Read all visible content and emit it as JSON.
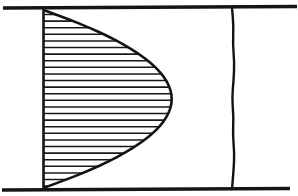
{
  "figure": {
    "background_color": "#ffffff",
    "ink_color": "#141414",
    "width": 298,
    "height": 196
  },
  "geometry": {
    "top_wall": {
      "name": "top-wall",
      "x1": 3,
      "y1": 8,
      "x2": 297,
      "y2": 6.5,
      "stroke_width": 3.4
    },
    "bottom_wall": {
      "name": "bottom-wall",
      "x1": 2,
      "y1": 190,
      "x2": 290,
      "y2": 188.5,
      "stroke_width": 3.4
    },
    "left_axis": {
      "name": "left-wall-axis",
      "x1": 43.5,
      "y1": 8,
      "x2": 43.5,
      "y2": 189,
      "stroke_width": 2.6
    },
    "laminar_profile": {
      "name": "laminar-parabolic-profile",
      "wall_x": 43.5,
      "apex_x": 172,
      "apex_y": 97,
      "top_y": 10,
      "bottom_y": 188,
      "stroke_width": 2.6
    },
    "turbulent_profile": {
      "name": "turbulent-flat-profile",
      "base_x": 232,
      "top_y": 8,
      "bottom_y": 189,
      "stroke_width": 2.4,
      "wave_amplitude": 2.4
    },
    "hatching": {
      "name": "hatch-fill",
      "line_count": 27,
      "spacing": 6.6,
      "first_y": 14.5,
      "stroke_width": 1.55,
      "orientation": "horizontal"
    }
  },
  "chart_data": {
    "type": "line",
    "xlabel": "",
    "ylabel": "",
    "grid": false,
    "legend": "none",
    "xlim": [
      0,
      1
    ],
    "ylim": [
      0,
      1
    ],
    "series": [
      {
        "name": "Laminar parabolic profile",
        "style": "hatched-filled-curve",
        "y_normalized": [
          0.0,
          0.05,
          0.1,
          0.15,
          0.2,
          0.25,
          0.3,
          0.35,
          0.4,
          0.45,
          0.5,
          0.55,
          0.6,
          0.65,
          0.7,
          0.75,
          0.8,
          0.85,
          0.9,
          0.95,
          1.0
        ],
        "u_normalized": [
          0.0,
          0.19,
          0.36,
          0.51,
          0.64,
          0.75,
          0.84,
          0.91,
          0.96,
          0.99,
          1.0,
          0.99,
          0.96,
          0.91,
          0.84,
          0.75,
          0.64,
          0.51,
          0.36,
          0.19,
          0.0
        ]
      },
      {
        "name": "Turbulent flat profile",
        "style": "wavy-near-vertical-line",
        "y_normalized": [
          0.0,
          0.1,
          0.2,
          0.3,
          0.4,
          0.5,
          0.6,
          0.7,
          0.8,
          0.9,
          1.0
        ],
        "u_normalized": [
          0.0,
          0.02,
          0.03,
          0.01,
          0.02,
          0.0,
          0.02,
          0.03,
          0.01,
          0.02,
          0.0
        ]
      }
    ],
    "annotations": []
  }
}
